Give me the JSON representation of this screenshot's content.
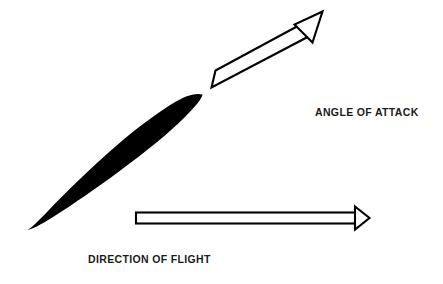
{
  "figure": {
    "background_color": "#ffffff",
    "ink_color": "#000000",
    "width": 443,
    "height": 284
  },
  "labels": {
    "angle_of_attack": "ANGLE OF ATTACK",
    "direction_of_flight": "DIRECTION OF FLIGHT"
  },
  "shapes": {
    "airfoil": {
      "name": "airfoil-cross-section",
      "fill": "#000000",
      "description": "solid black wing cross-section inclined upward to the right"
    },
    "chord_arrow": {
      "name": "angle-of-attack-arrow",
      "fill": "#ffffff",
      "stroke": "#000000",
      "direction": "up-right",
      "description": "hollow outlined arrow aligned with the wing chord line"
    },
    "flight_arrow": {
      "name": "direction-of-flight-arrow",
      "fill": "#ffffff",
      "stroke": "#000000",
      "direction": "right",
      "description": "hollow outlined horizontal arrow pointing right"
    }
  }
}
